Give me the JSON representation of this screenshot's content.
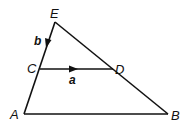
{
  "diagram": {
    "type": "geometry-triangle",
    "points": {
      "E": {
        "label": "E",
        "x": 55,
        "y": 22
      },
      "C": {
        "label": "C",
        "x": 40,
        "y": 69
      },
      "D": {
        "label": "D",
        "x": 113,
        "y": 69
      },
      "A": {
        "label": "A",
        "x": 24,
        "y": 114
      },
      "B": {
        "label": "B",
        "x": 168,
        "y": 114
      }
    },
    "segments": [
      "EA",
      "EB",
      "AB",
      "CD"
    ],
    "vectors": {
      "a": {
        "label": "a",
        "from": "C",
        "to": "D"
      },
      "b": {
        "label": "b",
        "from": "E",
        "to": "C"
      }
    },
    "stroke_color": "#111111"
  }
}
